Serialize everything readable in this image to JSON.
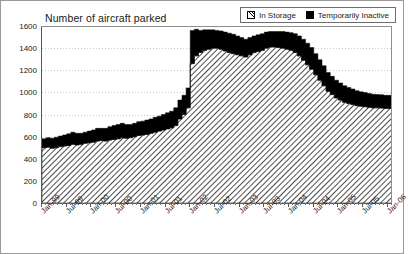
{
  "chart_data": {
    "type": "area",
    "title": "Number of aircraft parked",
    "xlabel": "",
    "ylabel": "",
    "ylim": [
      0,
      1600
    ],
    "ytick_step": 200,
    "yticks": [
      0,
      200,
      400,
      600,
      800,
      1000,
      1200,
      1400,
      1600
    ],
    "grid": true,
    "legend_position": "top-right",
    "stacked": true,
    "colors": {
      "in_storage": "#ffffff",
      "in_storage_pattern": "diagonal-hatch",
      "temporarily_inactive": "#000000",
      "axis": "#5a5a5a",
      "grid": "#c9c9c9",
      "border": "#9a9a9a",
      "text": "#1a1a1a"
    },
    "x_major_labels": [
      "Jan-99",
      "Jul-99",
      "Jan-00",
      "Jul-00",
      "Jan-01",
      "Jul-01",
      "Jan-02",
      "Jul-02",
      "Jan-03",
      "Jul-03",
      "Jan-04",
      "Jul-04",
      "Jan-05",
      "Jul-05",
      "Jan-06"
    ],
    "x": [
      "Jan-99",
      "Feb-99",
      "Mar-99",
      "Apr-99",
      "May-99",
      "Jun-99",
      "Jul-99",
      "Aug-99",
      "Sep-99",
      "Oct-99",
      "Nov-99",
      "Dec-99",
      "Jan-00",
      "Feb-00",
      "Mar-00",
      "Apr-00",
      "May-00",
      "Jun-00",
      "Jul-00",
      "Aug-00",
      "Sep-00",
      "Oct-00",
      "Nov-00",
      "Dec-00",
      "Jan-01",
      "Feb-01",
      "Mar-01",
      "Apr-01",
      "May-01",
      "Jun-01",
      "Jul-01",
      "Aug-01",
      "Sep-01",
      "Oct-01",
      "Nov-01",
      "Dec-01",
      "Jan-02",
      "Feb-02",
      "Mar-02",
      "Apr-02",
      "May-02",
      "Jun-02",
      "Jul-02",
      "Aug-02",
      "Sep-02",
      "Oct-02",
      "Nov-02",
      "Dec-02",
      "Jan-03",
      "Feb-03",
      "Mar-03",
      "Apr-03",
      "May-03",
      "Jun-03",
      "Jul-03",
      "Aug-03",
      "Sep-03",
      "Oct-03",
      "Nov-03",
      "Dec-03",
      "Jan-04",
      "Feb-04",
      "Mar-04",
      "Apr-04",
      "May-04",
      "Jun-04",
      "Jul-04",
      "Aug-04",
      "Sep-04",
      "Oct-04",
      "Nov-04",
      "Dec-04",
      "Jan-05",
      "Feb-05",
      "Mar-05",
      "Apr-05",
      "May-05",
      "Jun-05",
      "Jul-05",
      "Aug-05",
      "Sep-05",
      "Oct-05",
      "Nov-05",
      "Dec-05",
      "Jan-06"
    ],
    "series": [
      {
        "name": "In Storage",
        "pattern": "diagonal-hatch",
        "values": [
          500,
          505,
          495,
          500,
          510,
          515,
          520,
          530,
          525,
          530,
          540,
          545,
          550,
          560,
          565,
          560,
          570,
          575,
          580,
          590,
          585,
          590,
          600,
          610,
          615,
          620,
          630,
          640,
          650,
          660,
          670,
          680,
          700,
          760,
          800,
          860,
          1260,
          1330,
          1360,
          1380,
          1390,
          1400,
          1400,
          1390,
          1375,
          1360,
          1350,
          1340,
          1330,
          1320,
          1340,
          1360,
          1370,
          1380,
          1400,
          1410,
          1410,
          1405,
          1400,
          1390,
          1380,
          1360,
          1330,
          1290,
          1250,
          1210,
          1160,
          1110,
          1060,
          1010,
          980,
          950,
          930,
          910,
          900,
          890,
          880,
          875,
          870,
          865,
          860,
          860,
          858,
          855,
          855
        ]
      },
      {
        "name": "Temporarily Inactive",
        "color": "#000000",
        "values": [
          80,
          85,
          90,
          95,
          95,
          100,
          105,
          110,
          105,
          100,
          100,
          105,
          110,
          115,
          110,
          115,
          120,
          125,
          130,
          130,
          125,
          120,
          120,
          125,
          125,
          130,
          130,
          135,
          135,
          140,
          145,
          150,
          160,
          170,
          175,
          180,
          300,
          240,
          200,
          185,
          175,
          165,
          160,
          165,
          170,
          175,
          175,
          170,
          165,
          160,
          155,
          150,
          150,
          150,
          145,
          140,
          140,
          145,
          150,
          155,
          160,
          170,
          180,
          190,
          195,
          195,
          190,
          185,
          180,
          170,
          165,
          160,
          155,
          150,
          145,
          140,
          135,
          130,
          128,
          125,
          122,
          120,
          120,
          118,
          118
        ]
      }
    ]
  },
  "legend": {
    "items": [
      {
        "label": "In Storage",
        "swatch": "hatch-swatch-icon"
      },
      {
        "label": "Temporarily Inactive",
        "swatch": "solid-black-swatch-icon"
      }
    ]
  }
}
